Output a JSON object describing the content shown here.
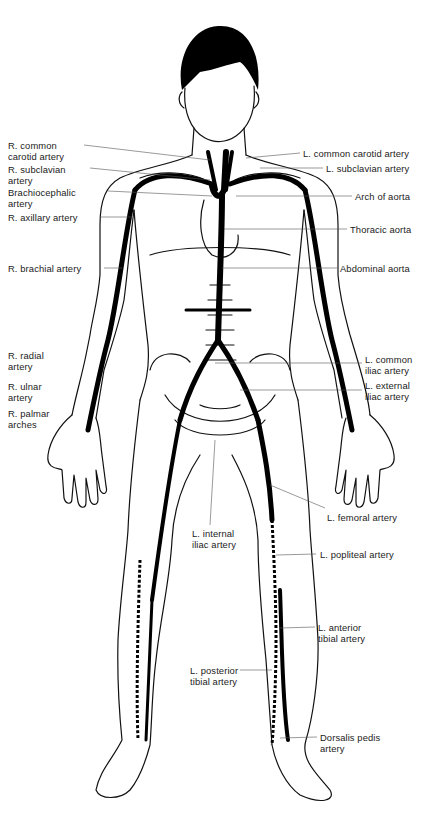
{
  "diagram": {
    "colors": {
      "outline": "#111111",
      "artery": "#000000",
      "leader": "#555555",
      "background": "#ffffff"
    },
    "labels_right_side_of_body": [
      {
        "id": "r-common-carotid",
        "text": "R. common\ncarotid artery",
        "x": 8,
        "y": 140
      },
      {
        "id": "r-subclavian",
        "text": "R. subclavian\nartery",
        "x": 8,
        "y": 164
      },
      {
        "id": "brachiocephalic",
        "text": "Brachiocephalic\nartery",
        "x": 8,
        "y": 187
      },
      {
        "id": "r-axillary",
        "text": "R. axillary artery",
        "x": 8,
        "y": 212
      },
      {
        "id": "r-brachial",
        "text": "R. brachial artery",
        "x": 8,
        "y": 263
      },
      {
        "id": "r-radial",
        "text": "R. radial\nartery",
        "x": 8,
        "y": 350
      },
      {
        "id": "r-ulnar",
        "text": "R. ulnar\nartery",
        "x": 8,
        "y": 381
      },
      {
        "id": "r-palmar",
        "text": "R. palmar\narches",
        "x": 8,
        "y": 408
      }
    ],
    "labels_left_side_of_body": [
      {
        "id": "l-common-carotid",
        "text": "L. common carotid artery",
        "x": 303,
        "y": 148
      },
      {
        "id": "l-subclavian",
        "text": "L. subclavian artery",
        "x": 326,
        "y": 163
      },
      {
        "id": "arch-aorta",
        "text": "Arch of aorta",
        "x": 355,
        "y": 191
      },
      {
        "id": "thoracic-aorta",
        "text": "Thoracic aorta",
        "x": 350,
        "y": 224
      },
      {
        "id": "abdominal-aorta",
        "text": "Abdominal aorta",
        "x": 340,
        "y": 263
      },
      {
        "id": "l-common-iliac",
        "text": "L. common\niliac artery",
        "x": 365,
        "y": 354
      },
      {
        "id": "l-external-iliac",
        "text": "L. external\niliac artery",
        "x": 365,
        "y": 380
      },
      {
        "id": "l-femoral",
        "text": "L. femoral artery",
        "x": 327,
        "y": 512
      },
      {
        "id": "l-internal-iliac",
        "text": "L. internal\niliac artery",
        "x": 192,
        "y": 528
      },
      {
        "id": "l-popliteal",
        "text": "L. popliteal artery",
        "x": 320,
        "y": 549
      },
      {
        "id": "l-anterior-tibial",
        "text": "L. anterior\ntibial artery",
        "x": 318,
        "y": 622
      },
      {
        "id": "l-posterior-tibial",
        "text": "L. posterior\ntibial artery",
        "x": 190,
        "y": 665
      },
      {
        "id": "dorsalis-pedis",
        "text": "Dorsalis pedis\nartery",
        "x": 320,
        "y": 732
      }
    ]
  }
}
